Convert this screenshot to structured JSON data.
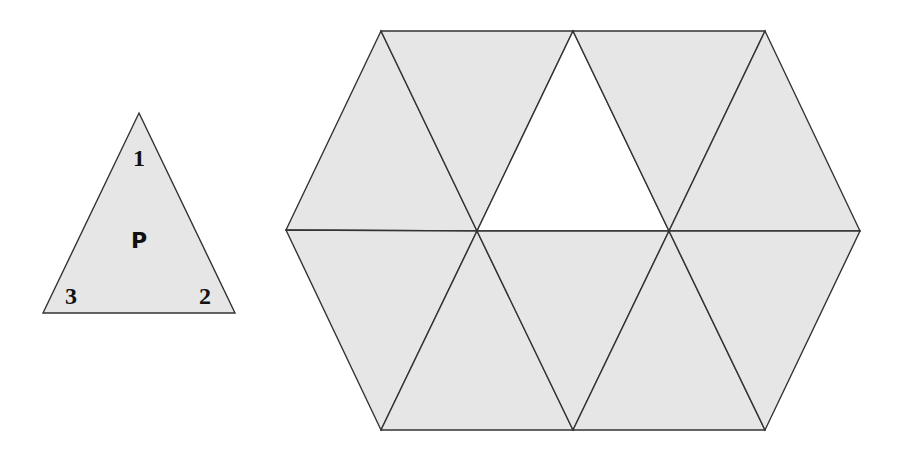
{
  "piece": {
    "label": "P",
    "corners": [
      "1",
      "2",
      "3"
    ],
    "vertices": [
      [
        139,
        113
      ],
      [
        235,
        313
      ],
      [
        43,
        313
      ]
    ]
  },
  "hexagon": {
    "fill": "#e6e6e6",
    "stroke": "#333333",
    "triangles": [
      {
        "pts": [
          [
            381,
            31
          ],
          [
            286,
            230
          ],
          [
            477,
            231
          ]
        ],
        "filled": true
      },
      {
        "pts": [
          [
            381,
            31
          ],
          [
            573,
            31
          ],
          [
            477,
            231
          ]
        ],
        "filled": true
      },
      {
        "pts": [
          [
            573,
            31
          ],
          [
            477,
            231
          ],
          [
            669,
            231
          ]
        ],
        "filled": false
      },
      {
        "pts": [
          [
            573,
            31
          ],
          [
            765,
            31
          ],
          [
            669,
            231
          ]
        ],
        "filled": true
      },
      {
        "pts": [
          [
            765,
            31
          ],
          [
            669,
            231
          ],
          [
            860,
            231
          ]
        ],
        "filled": true
      },
      {
        "pts": [
          [
            286,
            230
          ],
          [
            477,
            231
          ],
          [
            381,
            430
          ]
        ],
        "filled": true
      },
      {
        "pts": [
          [
            477,
            231
          ],
          [
            381,
            430
          ],
          [
            573,
            430
          ]
        ],
        "filled": true
      },
      {
        "pts": [
          [
            477,
            231
          ],
          [
            669,
            231
          ],
          [
            573,
            430
          ]
        ],
        "filled": true
      },
      {
        "pts": [
          [
            669,
            231
          ],
          [
            573,
            430
          ],
          [
            765,
            430
          ]
        ],
        "filled": true
      },
      {
        "pts": [
          [
            669,
            231
          ],
          [
            860,
            231
          ],
          [
            765,
            430
          ]
        ],
        "filled": true
      }
    ]
  }
}
